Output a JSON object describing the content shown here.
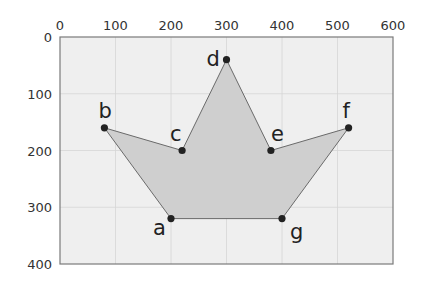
{
  "diagram": {
    "title": "",
    "x_axis": {
      "min": 0,
      "max": 600,
      "ticks": [
        0,
        100,
        200,
        300,
        400,
        500,
        600
      ],
      "position": "top"
    },
    "y_axis": {
      "min": 0,
      "max": 400,
      "ticks": [
        0,
        100,
        200,
        300,
        400
      ],
      "direction": "down"
    },
    "grid": true,
    "colors": {
      "background": "#efefef",
      "grid": "#d6d6d6",
      "frame": "#7a7a7a",
      "fill": "#cfcfcf",
      "edge": "#6a6a6a",
      "vertex": "#222222"
    },
    "polygon_order": [
      "a",
      "b",
      "c",
      "d",
      "e",
      "f",
      "g"
    ],
    "vertices": [
      {
        "label": "a",
        "x": 200,
        "y": 320,
        "label_dx": -18,
        "label_dy": 16
      },
      {
        "label": "b",
        "x": 80,
        "y": 160,
        "label_dx": -6,
        "label_dy": -10
      },
      {
        "label": "c",
        "x": 220,
        "y": 200,
        "label_dx": -12,
        "label_dy": -10
      },
      {
        "label": "d",
        "x": 300,
        "y": 40,
        "label_dx": -20,
        "label_dy": 6
      },
      {
        "label": "e",
        "x": 380,
        "y": 200,
        "label_dx": 0,
        "label_dy": -10
      },
      {
        "label": "f",
        "x": 520,
        "y": 160,
        "label_dx": -6,
        "label_dy": -10
      },
      {
        "label": "g",
        "x": 400,
        "y": 320,
        "label_dx": 8,
        "label_dy": 20
      }
    ]
  }
}
